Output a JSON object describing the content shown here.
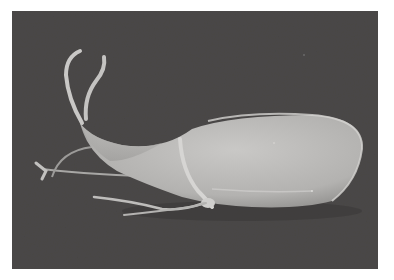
{
  "image": {
    "kind": "scanning electron micrograph",
    "subject": "flagellated protozoan (Giardia-like trophozoite), side view",
    "background_color": "#4a4847",
    "border_color": "#ffffff",
    "subject_color": "#bdbcba",
    "highlight_color": "#d8d7d5",
    "visible_parts": [
      "elongated teardrop body",
      "two anterior flagella curving upward",
      "posterior/ventral trailing flagella",
      "ventral flagella crossing body"
    ]
  }
}
